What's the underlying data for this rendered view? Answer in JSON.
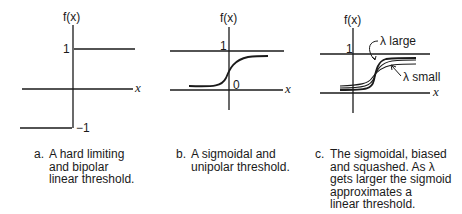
{
  "panels": [
    {
      "id": "a",
      "y_label": "f(x)",
      "x_label": "x",
      "ticks": {
        "top": "1",
        "bottom": "−1"
      },
      "caption_letter": "a.",
      "caption": "A hard limiting\nand bipolar\nlinear threshold."
    },
    {
      "id": "b",
      "y_label": "f(x)",
      "x_label": "x",
      "ticks": {
        "top": "1",
        "origin": "0"
      },
      "caption_letter": "b.",
      "caption": "A sigmoidal and\nunipolar threshold."
    },
    {
      "id": "c",
      "y_label": "f(x)",
      "x_label": "x",
      "ticks": {
        "top": "1"
      },
      "annotations": {
        "large": "λ large",
        "small": "λ small"
      },
      "caption_letter": "c.",
      "caption": "The sigmoidal, biased\nand squashed. As λ\ngets larger the sigmoid\napproximates a\nlinear threshold."
    }
  ],
  "colors": {
    "line": "#1a1a1a",
    "background": "#ffffff"
  }
}
